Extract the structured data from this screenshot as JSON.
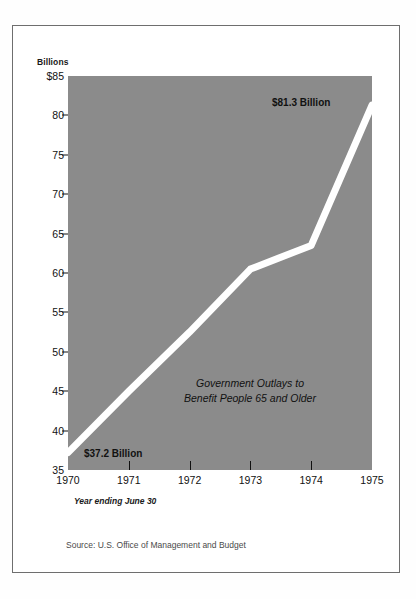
{
  "chart_data": {
    "type": "line",
    "title": "",
    "annotation_lines": [
      "Government Outlays to",
      "Benefit People 65 and Older"
    ],
    "units_label": "Billions",
    "xlabel": "",
    "ylabel": "",
    "axis_note": "Year ending June 30",
    "source": "Source: U.S. Office of Management and Budget",
    "grid": false,
    "legend": "none",
    "x": [
      1970,
      1971,
      1972,
      1973,
      1974,
      1975
    ],
    "categories": [
      "1970",
      "1971",
      "1972",
      "1973",
      "1974",
      "1975"
    ],
    "values": [
      37.2,
      45.0,
      52.5,
      60.5,
      63.5,
      81.3
    ],
    "series": [
      {
        "name": "Government outlays to benefit people 65 and older",
        "values": [
          37.2,
          45.0,
          52.5,
          60.5,
          63.5,
          81.3
        ]
      }
    ],
    "xlim": [
      1970,
      1975
    ],
    "ylim": [
      35,
      85
    ],
    "y_ticks": [
      35,
      40,
      45,
      50,
      55,
      60,
      65,
      70,
      75,
      80,
      85
    ],
    "y_tick_labels": [
      "35",
      "40",
      "45",
      "50",
      "55",
      "60",
      "65",
      "70",
      "75",
      "80",
      "$85"
    ],
    "x_ticks": [
      1970,
      1971,
      1972,
      1973,
      1974,
      1975
    ],
    "x_tick_labels": [
      "1970",
      "1971",
      "1972",
      "1973",
      "1974",
      "1975"
    ],
    "data_labels": [
      {
        "name": "start",
        "text": "$37.2 Billion",
        "x": 1970,
        "y": 37.2
      },
      {
        "name": "end",
        "text": "$81.3 Billion",
        "x": 1975,
        "y": 81.3
      }
    ],
    "colors": {
      "plot_background": "#8b8b8b",
      "line": "#ffffff",
      "figure_background": "#ffffff",
      "text": "#111111",
      "frame": "#6e6e6e"
    }
  }
}
